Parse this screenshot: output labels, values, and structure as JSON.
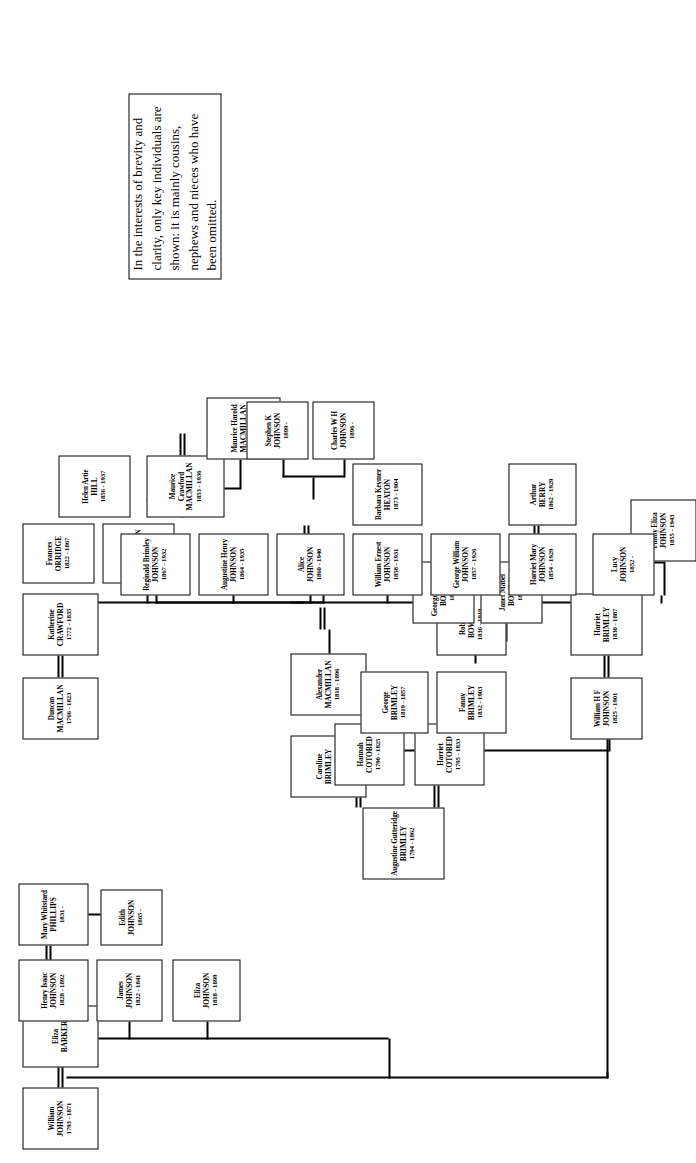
{
  "document": {
    "kind": "family-tree-chart",
    "orientation": "rotated-90-counterclockwise"
  },
  "note": {
    "text": "In the interests of brevity and clarity, only key individuals are shown: it is mainly cousins, nephews and nieces who have been omitted."
  },
  "people": [
    {
      "id": "p1",
      "given": "William",
      "surname": "JOHNSON",
      "dates": "1793 - 1871"
    },
    {
      "id": "p2",
      "given": "Eliza",
      "surname": "BARKER",
      "dates": ""
    },
    {
      "id": "p3",
      "given": "Eliza",
      "surname": "JOHNSON",
      "dates": "1818 - 1899"
    },
    {
      "id": "p4",
      "given": "James",
      "surname": "JOHNSON",
      "dates": "1822 - 1841"
    },
    {
      "id": "p5",
      "given": "Henry Isaac",
      "surname": "JOHNSON",
      "dates": "1828 - 1892"
    },
    {
      "id": "p6",
      "given": "Mary Whitstard",
      "surname": "PHILLIPS",
      "dates": "1831 -"
    },
    {
      "id": "p7",
      "given": "Edith",
      "surname": "JOHNSON",
      "dates": "1865 -"
    },
    {
      "id": "p8",
      "given": "Duncan",
      "surname": "MACMILLAN",
      "dates": "1766 - 1823"
    },
    {
      "id": "p9",
      "given": "Katherine",
      "surname": "CRAWFORD",
      "dates": "1772 - 1835"
    },
    {
      "id": "p10",
      "given": "Daniel",
      "surname": "MACMILLAN",
      "dates": "1813 - 1857"
    },
    {
      "id": "p11",
      "given": "Frances",
      "surname": "ORRIDGE",
      "dates": "1822 - 1867"
    },
    {
      "id": "p12",
      "given": "Maurice Crawford",
      "surname": "MACMILLAN",
      "dates": "1853 - 1936"
    },
    {
      "id": "p13",
      "given": "Helen Artie",
      "surname": "HILL",
      "dates": "1856 - 1937"
    },
    {
      "id": "p14",
      "given": "Maurice Harold",
      "surname": "MACMILLAN",
      "dates": "1894 - 1986"
    },
    {
      "id": "p15",
      "given": "Alexander",
      "surname": "MACMILLAN",
      "dates": "1818 - 1896"
    },
    {
      "id": "p16",
      "given": "Caroline",
      "surname": "BRIMLEY",
      "dates": "1824 - 1871"
    },
    {
      "id": "p17",
      "given": "Augustine Gutteridge",
      "surname": "BRIMLEY",
      "dates": "1794 - 1862"
    },
    {
      "id": "p18",
      "given": "Hannah",
      "surname": "COTOBED",
      "dates": "1790 - 1825"
    },
    {
      "id": "p19",
      "given": "Harriet",
      "surname": "COTOBED",
      "dates": "1795 - 1833"
    },
    {
      "id": "p20",
      "given": "George",
      "surname": "BRIMLEY",
      "dates": "1819 - 1857"
    },
    {
      "id": "p21",
      "given": "Fanny",
      "surname": "BRIMLEY",
      "dates": "1832 - 1903"
    },
    {
      "id": "p22",
      "given": "Robert",
      "surname": "BOWES",
      "dates": "1836 - 1919"
    },
    {
      "id": "p23",
      "given": "Janet Mabel",
      "surname": "BOWES",
      "dates": "1871 -"
    },
    {
      "id": "p24",
      "given": "George Brimley",
      "surname": "BOWES",
      "dates": "1874 -"
    },
    {
      "id": "p25",
      "given": "William H F",
      "surname": "JOHNSON",
      "dates": "1825 - 1901"
    },
    {
      "id": "p26",
      "given": "Harriet",
      "surname": "BRIMLEY",
      "dates": "1830 - 1887"
    },
    {
      "id": "p27",
      "given": "Fanny Eliza",
      "surname": "JOHNSON",
      "dates": "1855 - 1943"
    },
    {
      "id": "p28",
      "given": "Lucy",
      "surname": "JOHNSON",
      "dates": "1852 -"
    },
    {
      "id": "p29",
      "given": "Harriet Mary",
      "surname": "JOHNSON",
      "dates": "1854 - 1929"
    },
    {
      "id": "p30",
      "given": "Arthur",
      "surname": "BERRY",
      "dates": "1862 - 1929"
    },
    {
      "id": "p31",
      "given": "George William",
      "surname": "JOHNSON",
      "dates": "1857 - 1926"
    },
    {
      "id": "p32",
      "given": "William Ernest",
      "surname": "JOHNSON",
      "dates": "1858 - 1931"
    },
    {
      "id": "p33",
      "given": "Barbara Keymer",
      "surname": "HEATON",
      "dates": "1873 - 1904"
    },
    {
      "id": "p34",
      "given": "Charles W H",
      "surname": "JOHNSON",
      "dates": "1896 -"
    },
    {
      "id": "p35",
      "given": "Stephen K",
      "surname": "JOHNSON",
      "dates": "1899 -"
    },
    {
      "id": "p36",
      "given": "Alice",
      "surname": "JOHNSON",
      "dates": "1860 - 1940"
    },
    {
      "id": "p37",
      "given": "Augustine Henry",
      "surname": "JOHNSON",
      "dates": "1864 - 1935"
    },
    {
      "id": "p38",
      "given": "Reginald Brimley",
      "surname": "JOHNSON",
      "dates": "1867 - 1932"
    }
  ]
}
